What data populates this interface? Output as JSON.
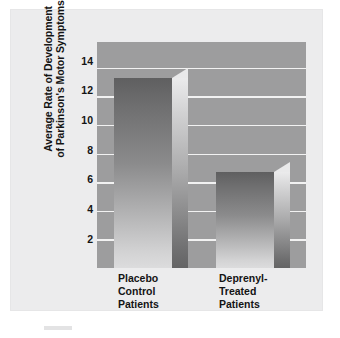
{
  "figure": {
    "background_color": "#ffffff",
    "panel_color": "#ececed",
    "plot_background_color": "#9d9d9e",
    "gridline_color": "#f2f2f2",
    "text_color": "#141414"
  },
  "axis": {
    "y_title_line1": "Average Rate of Development",
    "y_title_line2": "of Parkinson's Motor Symptoms",
    "y_ticks": [
      "14",
      "12",
      "10",
      "8",
      "6",
      "4",
      "2"
    ]
  },
  "categories": [
    {
      "line1": "Placebo",
      "line2": "Control",
      "line3": "Patients"
    },
    {
      "line1": "Deprenyl-",
      "line2": "Treated",
      "line3": "Patients"
    }
  ],
  "chart_data": {
    "type": "bar",
    "title": "",
    "subtitle": "",
    "xlabel": "",
    "ylabel": "Average Rate of Development of Parkinson's Motor Symptoms",
    "categories": [
      "Placebo Control Patients",
      "Deprenyl-Treated Patients"
    ],
    "values": [
      13.3,
      6.7
    ],
    "ylim": [
      0,
      15.8
    ],
    "ytick_values": [
      2,
      4,
      6,
      8,
      10,
      12,
      14
    ],
    "ytick_labels": [
      "2",
      "4",
      "6",
      "8",
      "10",
      "12",
      "14"
    ],
    "grid": true,
    "legend": null,
    "style": "3d-shaded-grayscale-bars",
    "annotations": []
  }
}
